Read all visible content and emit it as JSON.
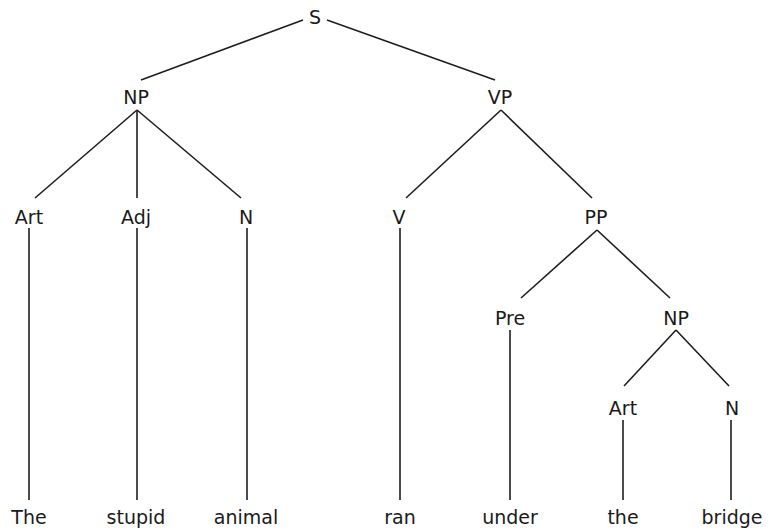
{
  "diagram": {
    "type": "syntax-tree",
    "sentence": "The stupid animal ran under the bridge",
    "nodes": [
      {
        "id": "S",
        "label": "S",
        "x": 315,
        "y": 17
      },
      {
        "id": "NP1",
        "label": "NP",
        "x": 136,
        "y": 97
      },
      {
        "id": "VP",
        "label": "VP",
        "x": 500,
        "y": 97
      },
      {
        "id": "Art1",
        "label": "Art",
        "x": 29,
        "y": 217
      },
      {
        "id": "Adj",
        "label": "Adj",
        "x": 136,
        "y": 217
      },
      {
        "id": "N1",
        "label": "N",
        "x": 246,
        "y": 217
      },
      {
        "id": "V",
        "label": "V",
        "x": 399,
        "y": 217
      },
      {
        "id": "PP",
        "label": "PP",
        "x": 596,
        "y": 217
      },
      {
        "id": "Pre",
        "label": "Pre",
        "x": 510,
        "y": 318
      },
      {
        "id": "NP2",
        "label": "NP",
        "x": 676,
        "y": 318
      },
      {
        "id": "Art2",
        "label": "Art",
        "x": 623,
        "y": 408
      },
      {
        "id": "N2",
        "label": "N",
        "x": 732,
        "y": 408
      },
      {
        "id": "w1",
        "label": "The",
        "x": 29,
        "y": 517
      },
      {
        "id": "w2",
        "label": "stupid",
        "x": 136,
        "y": 517
      },
      {
        "id": "w3",
        "label": "animal",
        "x": 246,
        "y": 517
      },
      {
        "id": "w4",
        "label": "ran",
        "x": 400,
        "y": 517
      },
      {
        "id": "w5",
        "label": "under",
        "x": 510,
        "y": 517
      },
      {
        "id": "w6",
        "label": "the",
        "x": 623,
        "y": 517
      },
      {
        "id": "w7",
        "label": "bridge",
        "x": 732,
        "y": 517
      }
    ],
    "edges": [
      {
        "x1": 303,
        "y1": 20,
        "x2": 141,
        "y2": 80
      },
      {
        "x1": 327,
        "y1": 20,
        "x2": 495,
        "y2": 80
      },
      {
        "x1": 137,
        "y1": 110,
        "x2": 35,
        "y2": 198
      },
      {
        "x1": 137,
        "y1": 110,
        "x2": 137,
        "y2": 198
      },
      {
        "x1": 137,
        "y1": 110,
        "x2": 241,
        "y2": 198
      },
      {
        "x1": 501,
        "y1": 110,
        "x2": 406,
        "y2": 198
      },
      {
        "x1": 501,
        "y1": 110,
        "x2": 592,
        "y2": 198
      },
      {
        "x1": 597,
        "y1": 230,
        "x2": 521,
        "y2": 298
      },
      {
        "x1": 597,
        "y1": 230,
        "x2": 670,
        "y2": 298
      },
      {
        "x1": 676,
        "y1": 330,
        "x2": 624,
        "y2": 386
      },
      {
        "x1": 676,
        "y1": 330,
        "x2": 729,
        "y2": 386
      },
      {
        "x1": 29,
        "y1": 228,
        "x2": 29,
        "y2": 500
      },
      {
        "x1": 137,
        "y1": 228,
        "x2": 137,
        "y2": 500
      },
      {
        "x1": 247,
        "y1": 228,
        "x2": 247,
        "y2": 500
      },
      {
        "x1": 400,
        "y1": 228,
        "x2": 400,
        "y2": 500
      },
      {
        "x1": 510,
        "y1": 330,
        "x2": 510,
        "y2": 500
      },
      {
        "x1": 623,
        "y1": 420,
        "x2": 623,
        "y2": 500
      },
      {
        "x1": 731,
        "y1": 420,
        "x2": 731,
        "y2": 500
      }
    ]
  }
}
